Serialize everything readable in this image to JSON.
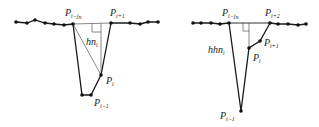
{
  "colors": {
    "line": "#1a1a1a",
    "thin_line": "#555555",
    "dot": "#111111",
    "text": "#222222",
    "background": "#ffffff"
  },
  "left_diagram": {
    "labels": {
      "p_ijn": {
        "base": "P",
        "sub": "i−j",
        "subsub": "n"
      },
      "p_i1": {
        "base": "P",
        "sub": "i+1"
      },
      "p_i": {
        "base": "P",
        "sub": "i"
      },
      "p_im1": {
        "base": "P",
        "sub": "i−1"
      },
      "height": {
        "base": "hn",
        "sub": "i"
      }
    }
  },
  "right_diagram": {
    "labels": {
      "p_ijn": {
        "base": "P",
        "sub": "i−j",
        "subsub": "n"
      },
      "p_i2": {
        "base": "P",
        "sub": "i+2"
      },
      "p_i1": {
        "base": "P",
        "sub": "i+1"
      },
      "p_i": {
        "base": "P",
        "sub": "i"
      },
      "p_im1": {
        "base": "P",
        "sub": "i−1"
      },
      "height": {
        "base": "hhn",
        "sub": "i"
      }
    }
  }
}
